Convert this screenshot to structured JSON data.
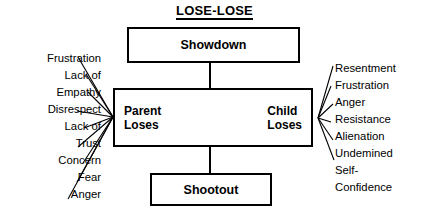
{
  "title": "LOSE-LOSE",
  "boxes": {
    "top": "Showdown",
    "bottom": "Shootout",
    "center_left": "Parent\nLoses",
    "center_left_line1": "Parent",
    "center_left_line2": "Loses",
    "center_right_line1": "Child",
    "center_right_line2": "Loses"
  },
  "left_labels": [
    "Frustration",
    "Lack of",
    "Empathy",
    "Disrespect",
    "Lack of",
    "Trust",
    "Concern",
    "Fear",
    "Anger"
  ],
  "right_labels": [
    "Resentment",
    "Frustration",
    "Anger",
    "Resistance",
    "Alienation",
    "Undemined",
    "Self-",
    "Confidence"
  ],
  "center_icon": "two-figures-clash-icon",
  "colors": {
    "stroke": "#000000",
    "background": "#ffffff",
    "text": "#000000"
  }
}
